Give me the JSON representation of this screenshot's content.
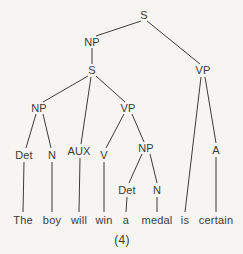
{
  "figure": {
    "caption": "(4)",
    "caption_pos": {
      "x": 122,
      "y": 240
    },
    "background_color": "#f6f5f1",
    "ink_color": "#3b3b3b"
  },
  "tree": {
    "nodes": [
      {
        "id": "s-top",
        "label": "S",
        "x": 144,
        "y": 15
      },
      {
        "id": "np-1",
        "label": "NP",
        "x": 92,
        "y": 42
      },
      {
        "id": "s-embed",
        "label": "S",
        "x": 92,
        "y": 70
      },
      {
        "id": "vp-main",
        "label": "VP",
        "x": 203,
        "y": 70
      },
      {
        "id": "np-2",
        "label": "NP",
        "x": 39,
        "y": 108
      },
      {
        "id": "vp-2",
        "label": "VP",
        "x": 128,
        "y": 108
      },
      {
        "id": "det-1",
        "label": "Det",
        "x": 24,
        "y": 155
      },
      {
        "id": "n-1",
        "label": "N",
        "x": 52,
        "y": 155
      },
      {
        "id": "aux-1",
        "label": "AUX",
        "x": 79,
        "y": 151
      },
      {
        "id": "v-1",
        "label": "V",
        "x": 104,
        "y": 155
      },
      {
        "id": "np-3",
        "label": "NP",
        "x": 146,
        "y": 148
      },
      {
        "id": "a-1",
        "label": "A",
        "x": 216,
        "y": 150
      },
      {
        "id": "det-2",
        "label": "Det",
        "x": 127,
        "y": 190
      },
      {
        "id": "n-2",
        "label": "N",
        "x": 157,
        "y": 190
      }
    ],
    "edges": [
      {
        "from": "s-top",
        "to": "np-1",
        "x1": 141,
        "y1": 21,
        "x2": 96,
        "y2": 36
      },
      {
        "from": "s-top",
        "to": "vp-main",
        "x1": 147,
        "y1": 21,
        "x2": 200,
        "y2": 64
      },
      {
        "from": "np-1",
        "to": "s-embed",
        "x1": 92,
        "y1": 48,
        "x2": 92,
        "y2": 64
      },
      {
        "from": "s-embed",
        "to": "np-2",
        "x1": 88,
        "y1": 76,
        "x2": 43,
        "y2": 102
      },
      {
        "from": "s-embed",
        "to": "aux-1",
        "x1": 91,
        "y1": 77,
        "x2": 81,
        "y2": 144
      },
      {
        "from": "s-embed",
        "to": "vp-2",
        "x1": 96,
        "y1": 76,
        "x2": 125,
        "y2": 102
      },
      {
        "from": "np-2",
        "to": "det-1",
        "x1": 36,
        "y1": 114,
        "x2": 26,
        "y2": 148
      },
      {
        "from": "np-2",
        "to": "n-1",
        "x1": 43,
        "y1": 114,
        "x2": 51,
        "y2": 148
      },
      {
        "from": "vp-2",
        "to": "v-1",
        "x1": 124,
        "y1": 114,
        "x2": 106,
        "y2": 148
      },
      {
        "from": "vp-2",
        "to": "np-3",
        "x1": 132,
        "y1": 114,
        "x2": 144,
        "y2": 142
      },
      {
        "from": "np-3",
        "to": "det-2",
        "x1": 142,
        "y1": 154,
        "x2": 129,
        "y2": 183
      },
      {
        "from": "np-3",
        "to": "n-2",
        "x1": 150,
        "y1": 154,
        "x2": 157,
        "y2": 183
      },
      {
        "from": "vp-main",
        "to": "is",
        "x1": 201,
        "y1": 77,
        "x2": 185,
        "y2": 212
      },
      {
        "from": "vp-main",
        "to": "a-1",
        "x1": 205,
        "y1": 77,
        "x2": 216,
        "y2": 143
      },
      {
        "from": "det-1",
        "to": "the",
        "x1": 24,
        "y1": 162,
        "x2": 23,
        "y2": 212
      },
      {
        "from": "n-1",
        "to": "boy",
        "x1": 52,
        "y1": 162,
        "x2": 52,
        "y2": 212
      },
      {
        "from": "aux-1",
        "to": "will",
        "x1": 80,
        "y1": 158,
        "x2": 79,
        "y2": 212
      },
      {
        "from": "v-1",
        "to": "win",
        "x1": 104,
        "y1": 162,
        "x2": 104,
        "y2": 212
      },
      {
        "from": "det-2",
        "to": "a",
        "x1": 127,
        "y1": 197,
        "x2": 126,
        "y2": 212
      },
      {
        "from": "n-2",
        "to": "medal",
        "x1": 157,
        "y1": 197,
        "x2": 157,
        "y2": 212
      },
      {
        "from": "a-1",
        "to": "certain",
        "x1": 216,
        "y1": 157,
        "x2": 216,
        "y2": 212
      }
    ],
    "words": [
      {
        "id": "the",
        "text": "The",
        "x": 23,
        "y": 220
      },
      {
        "id": "boy",
        "text": "boy",
        "x": 52,
        "y": 220
      },
      {
        "id": "will",
        "text": "will",
        "x": 79,
        "y": 220
      },
      {
        "id": "win",
        "text": "win",
        "x": 104,
        "y": 220
      },
      {
        "id": "a",
        "text": "a",
        "x": 126,
        "y": 220
      },
      {
        "id": "medal",
        "text": "medal",
        "x": 157,
        "y": 220
      },
      {
        "id": "is",
        "text": "is",
        "x": 185,
        "y": 220
      },
      {
        "id": "certain",
        "text": "certain",
        "x": 216,
        "y": 220
      }
    ],
    "sentence": "The boy will win a medal is certain"
  }
}
